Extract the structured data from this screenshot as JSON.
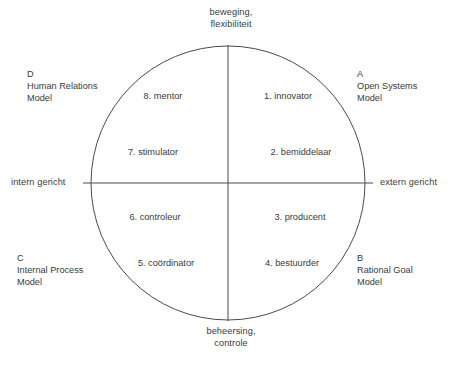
{
  "diagram": {
    "stroke_color": "#4a4a4a",
    "text_color": "#3a3a3a",
    "background_color": "#ffffff",
    "axes": {
      "top": {
        "line1": "beweging,",
        "line2": "flexibiliteit"
      },
      "bottom": {
        "line1": "beheersing,",
        "line2": "controle"
      },
      "left": "intern gericht",
      "right": "extern gericht"
    },
    "models": [
      {
        "letter": "A",
        "name_line1": "Open Systems",
        "name_line2": "Model",
        "position": "top-right"
      },
      {
        "letter": "B",
        "name_line1": "Rational Goal",
        "name_line2": "Model",
        "position": "bottom-right"
      },
      {
        "letter": "C",
        "name_line1": "Internal Process",
        "name_line2": "Model",
        "position": "bottom-left"
      },
      {
        "letter": "D",
        "name_line1": "Human Relations",
        "name_line2": "Model",
        "position": "top-left"
      }
    ],
    "roles": [
      {
        "number": "1.",
        "label": "1. innovator",
        "quadrant": "A"
      },
      {
        "number": "2.",
        "label": "2. bemiddelaar",
        "quadrant": "A"
      },
      {
        "number": "3.",
        "label": "3. producent",
        "quadrant": "B"
      },
      {
        "number": "4.",
        "label": "4. bestuurder",
        "quadrant": "B"
      },
      {
        "number": "5.",
        "label": "5. coördinator",
        "quadrant": "C"
      },
      {
        "number": "6.",
        "label": "6. controleur",
        "quadrant": "C"
      },
      {
        "number": "7.",
        "label": "7. stimulator",
        "quadrant": "D"
      },
      {
        "number": "8.",
        "label": "8. mentor",
        "quadrant": "D"
      }
    ],
    "geometry": {
      "center_x": 228,
      "center_y": 183,
      "radius": 137
    }
  }
}
